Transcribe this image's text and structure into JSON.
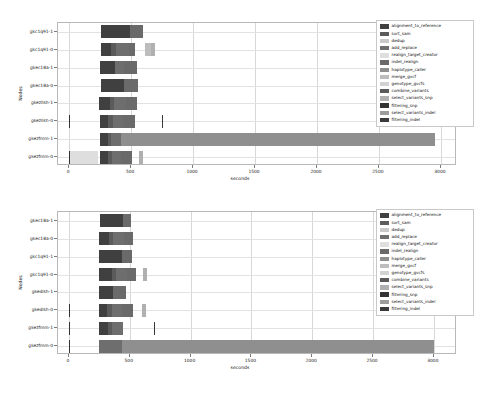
{
  "figure": {
    "xlabel": "seconds",
    "ylabel": "Nodes"
  },
  "legend_series": [
    {
      "name": "alignment_to_reference",
      "color": "#404040"
    },
    {
      "name": "sort_sam",
      "color": "#5b5b5b"
    },
    {
      "name": "dedup",
      "color": "#c9c9c9"
    },
    {
      "name": "add_replace",
      "color": "#6e6e6e"
    },
    {
      "name": "realign_target_creator",
      "color": "#dedede"
    },
    {
      "name": "indel_realign",
      "color": "#6a6a6a"
    },
    {
      "name": "haplotype_caller",
      "color": "#8f8f8f"
    },
    {
      "name": "merge_gvcf",
      "color": "#bdbdbd"
    },
    {
      "name": "genotype_gvcfs",
      "color": "#d2d2d2"
    },
    {
      "name": "combine_variants",
      "color": "#5a5a5a"
    },
    {
      "name": "select_variants_snp",
      "color": "#b0b0b0"
    },
    {
      "name": "filtering_snp",
      "color": "#333333"
    },
    {
      "name": "select_variants_indel",
      "color": "#9c9c9c"
    },
    {
      "name": "filtering_indel",
      "color": "#3a3a3a"
    }
  ],
  "chart_data": [
    {
      "type": "bar",
      "orientation": "horizontal",
      "stacked": true,
      "title": "",
      "xlabel": "seconds",
      "ylabel": "Nodes",
      "xlim": [
        -90,
        3130
      ],
      "xticks": [
        0,
        500,
        1000,
        1500,
        2000,
        2500,
        3000
      ],
      "grid": true,
      "legend_position": "upper right",
      "categories": [
        "gkc1q91-1",
        "gkc1q91-0",
        "gkec18a-1",
        "gkec18a-0",
        "gkezllsh-1",
        "gkezllsh-0",
        "gkezfmm-1",
        "gkezfmm-0"
      ],
      "series": [
        {
          "name": "alignment_to_reference",
          "starts": [
            260,
            255,
            250,
            258,
            240,
            245,
            250,
            250
          ],
          "widths": [
            235,
            80,
            120,
            185,
            90,
            65,
            65,
            65
          ]
        },
        {
          "name": "sort_sam",
          "starts": [
            495,
            335,
            370,
            443,
            330,
            310,
            315,
            315
          ],
          "widths": [
            0,
            45,
            0,
            0,
            35,
            40,
            25,
            30
          ]
        },
        {
          "name": "dedup",
          "starts": [
            495,
            380,
            370,
            443,
            365,
            350,
            340,
            345
          ],
          "widths": [
            0,
            0,
            0,
            0,
            0,
            0,
            0,
            0
          ]
        },
        {
          "name": "add_replace",
          "starts": [
            495,
            380,
            370,
            443,
            365,
            350,
            340,
            345
          ],
          "widths": [
            0,
            105,
            75,
            0,
            95,
            85,
            75,
            70
          ]
        },
        {
          "name": "realign_target_creator",
          "starts": [
            0,
            0,
            0,
            0,
            0,
            0,
            0,
            0
          ],
          "widths": [
            0,
            0,
            0,
            0,
            0,
            0,
            0,
            230
          ]
        },
        {
          "name": "indel_realign",
          "starts": [
            495,
            485,
            445,
            443,
            460,
            435,
            415,
            415
          ],
          "widths": [
            105,
            45,
            100,
            115,
            85,
            95,
            0,
            95
          ]
        },
        {
          "name": "haplotype_caller",
          "starts": [
            600,
            530,
            545,
            558,
            545,
            530,
            415,
            510
          ],
          "widths": [
            0,
            0,
            0,
            0,
            0,
            0,
            2540,
            0
          ]
        },
        {
          "name": "merge_gvcf",
          "starts": [
            600,
            615,
            545,
            558,
            545,
            530,
            2955,
            510
          ],
          "widths": [
            0,
            45,
            0,
            0,
            0,
            0,
            0,
            0
          ]
        },
        {
          "name": "genotype_gvcfs",
          "starts": [
            600,
            660,
            545,
            558,
            545,
            530,
            2955,
            510
          ],
          "widths": [
            0,
            0,
            0,
            0,
            0,
            0,
            0,
            0
          ]
        },
        {
          "name": "combine_variants",
          "starts": [
            600,
            660,
            545,
            558,
            545,
            530,
            2955,
            510
          ],
          "widths": [
            0,
            0,
            0,
            0,
            0,
            0,
            0,
            0
          ]
        },
        {
          "name": "select_variants_snp",
          "starts": [
            600,
            660,
            545,
            558,
            545,
            640,
            2955,
            560
          ],
          "widths": [
            0,
            35,
            0,
            0,
            0,
            0,
            0,
            35
          ]
        },
        {
          "name": "filtering_snp",
          "starts": [
            0,
            0,
            0,
            0,
            0,
            0,
            0,
            0
          ],
          "widths": [
            0,
            0,
            0,
            0,
            0,
            8,
            0,
            8
          ]
        },
        {
          "name": "select_variants_indel",
          "starts": [
            600,
            660,
            545,
            558,
            545,
            640,
            2955,
            560
          ],
          "widths": [
            0,
            0,
            0,
            0,
            0,
            0,
            0,
            0
          ]
        },
        {
          "name": "filtering_indel",
          "starts": [
            0,
            0,
            0,
            0,
            0,
            750,
            0,
            0
          ],
          "widths": [
            0,
            0,
            0,
            0,
            0,
            8,
            0,
            0
          ]
        }
      ]
    },
    {
      "type": "bar",
      "orientation": "horizontal",
      "stacked": true,
      "title": "",
      "xlabel": "seconds",
      "ylabel": "Nodes",
      "xlim": [
        -90,
        3190
      ],
      "xticks": [
        0,
        500,
        1000,
        1500,
        2000,
        2500,
        3000
      ],
      "grid": true,
      "legend_position": "upper right",
      "categories": [
        "gkec18a-1",
        "gkec18a-0",
        "gkc1q91-1",
        "gkc1q91-0",
        "gkedlsh-1",
        "gkedlsh-0",
        "gkezfmm-1",
        "gkezfmm-0"
      ],
      "series": [
        {
          "name": "alignment_to_reference",
          "starts": [
            255,
            250,
            250,
            250,
            250,
            245,
            245,
            250
          ],
          "widths": [
            190,
            80,
            190,
            100,
            115,
            70,
            80,
            0
          ]
        },
        {
          "name": "sort_sam",
          "starts": [
            445,
            330,
            440,
            350,
            365,
            315,
            325,
            250
          ],
          "widths": [
            0,
            35,
            0,
            35,
            0,
            35,
            30,
            0
          ]
        },
        {
          "name": "add_replace",
          "starts": [
            445,
            365,
            440,
            385,
            365,
            350,
            355,
            250
          ],
          "widths": [
            0,
            85,
            0,
            95,
            0,
            90,
            90,
            185
          ]
        },
        {
          "name": "realign_target_creator",
          "starts": [
            0,
            0,
            0,
            0,
            0,
            0,
            0,
            0
          ],
          "widths": [
            0,
            0,
            0,
            0,
            0,
            0,
            0,
            0
          ]
        },
        {
          "name": "indel_realign",
          "starts": [
            445,
            450,
            440,
            480,
            365,
            440,
            445,
            435
          ],
          "widths": [
            65,
            80,
            75,
            70,
            105,
            90,
            0,
            0
          ]
        },
        {
          "name": "haplotype_caller",
          "starts": [
            510,
            530,
            515,
            550,
            470,
            530,
            445,
            435
          ],
          "widths": [
            0,
            0,
            0,
            0,
            0,
            0,
            0,
            2565
          ]
        },
        {
          "name": "select_variants_snp",
          "starts": [
            510,
            530,
            515,
            610,
            470,
            600,
            445,
            3000
          ],
          "widths": [
            0,
            0,
            0,
            35,
            0,
            35,
            0,
            0
          ]
        },
        {
          "name": "filtering_snp",
          "starts": [
            0,
            0,
            0,
            0,
            0,
            0,
            0,
            0
          ],
          "widths": [
            0,
            0,
            0,
            0,
            0,
            8,
            8,
            8
          ]
        },
        {
          "name": "filtering_indel",
          "starts": [
            0,
            0,
            0,
            0,
            0,
            0,
            700,
            0
          ],
          "widths": [
            0,
            0,
            0,
            0,
            0,
            0,
            8,
            0
          ]
        }
      ]
    }
  ]
}
